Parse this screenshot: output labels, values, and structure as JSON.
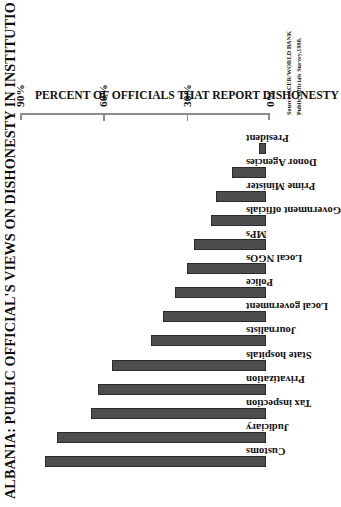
{
  "chart_data": {
    "type": "bar",
    "title": "ALBANIA: PUBLIC OFFICIAL'S VIEWS ON DISHONESTY IN INSTITUTIO",
    "orientation": "vertical",
    "xlabel": "",
    "ylabel": "PERCENT OF OFFICIALS THAT REPORT DISHONESTY",
    "ylim": [
      0,
      90
    ],
    "tick_labels": [
      "0%",
      "30%",
      "60%",
      "90%"
    ],
    "tick_values": [
      0,
      30,
      60,
      90
    ],
    "grid": false,
    "legend": false,
    "bar_color": "#4d4d4d",
    "bar_edge_color": "#2b2b2b",
    "categories": [
      "Customs",
      "Judiciary",
      "Tax inspection",
      "Privatization",
      "State hospitals",
      "Journalists",
      "Local government",
      "Police",
      "Local NGOs",
      "MPs",
      "Government officials",
      "Prime Minister",
      "Donor Agencies",
      "President"
    ],
    "values": [
      92,
      87,
      73,
      70,
      64,
      48,
      43,
      38,
      33,
      30,
      23,
      21,
      14,
      3
    ]
  },
  "source_note": {
    "line1": "Source:ACER/WORLD BANK",
    "line2": "Public Officials Survey,1998."
  }
}
